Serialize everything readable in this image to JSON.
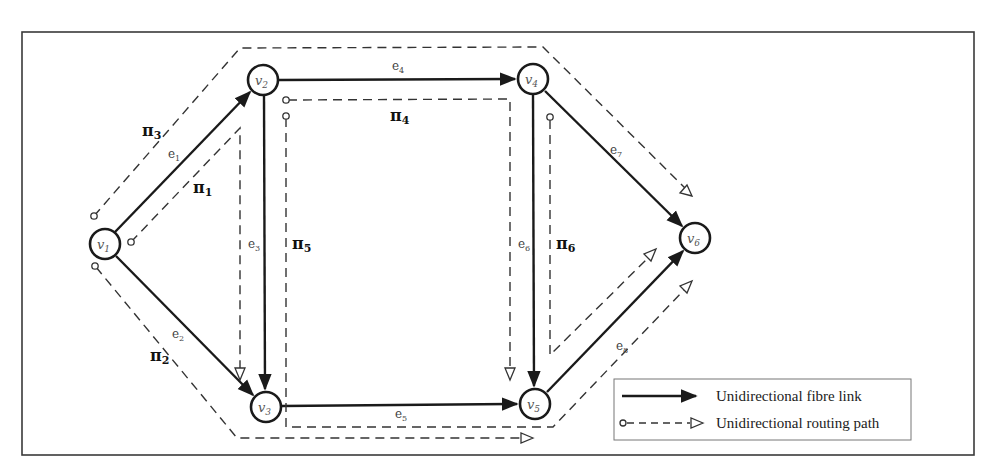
{
  "diagram": {
    "nodes": [
      {
        "id": "v1",
        "label": "v",
        "sub": "1",
        "x": 105,
        "y": 244
      },
      {
        "id": "v2",
        "label": "v",
        "sub": "2",
        "x": 263,
        "y": 80
      },
      {
        "id": "v3",
        "label": "v",
        "sub": "3",
        "x": 266,
        "y": 407
      },
      {
        "id": "v4",
        "label": "v",
        "sub": "4",
        "x": 533,
        "y": 79
      },
      {
        "id": "v5",
        "label": "v",
        "sub": "5",
        "x": 535,
        "y": 404
      },
      {
        "id": "v6",
        "label": "v",
        "sub": "6",
        "x": 695,
        "y": 238
      }
    ],
    "edges": [
      {
        "id": "e1",
        "label": "e",
        "sub": "1",
        "from": "v1",
        "to": "v2"
      },
      {
        "id": "e2",
        "label": "e",
        "sub": "2",
        "from": "v1",
        "to": "v3"
      },
      {
        "id": "e3",
        "label": "e",
        "sub": "3",
        "from": "v2",
        "to": "v3"
      },
      {
        "id": "e4",
        "label": "e",
        "sub": "4",
        "from": "v2",
        "to": "v4"
      },
      {
        "id": "e5",
        "label": "e",
        "sub": "5",
        "from": "v3",
        "to": "v5"
      },
      {
        "id": "e6",
        "label": "e",
        "sub": "6",
        "from": "v4",
        "to": "v5"
      },
      {
        "id": "e7",
        "label": "e",
        "sub": "7",
        "from": "v4",
        "to": "v6"
      },
      {
        "id": "e8",
        "label": "e",
        "sub": "8",
        "from": "v5",
        "to": "v6"
      }
    ],
    "paths": [
      {
        "id": "pi1",
        "label": "π",
        "sub": "1",
        "route": [
          "v1",
          "v2",
          "v3"
        ]
      },
      {
        "id": "pi2",
        "label": "π",
        "sub": "2",
        "route": [
          "v1",
          "v3",
          "v5"
        ]
      },
      {
        "id": "pi3",
        "label": "π",
        "sub": "3",
        "route": [
          "v1",
          "v2",
          "v4",
          "v6"
        ]
      },
      {
        "id": "pi4",
        "label": "π",
        "sub": "4",
        "route": [
          "v2",
          "v4",
          "v5"
        ]
      },
      {
        "id": "pi5",
        "label": "π",
        "sub": "5",
        "route": [
          "v2",
          "v3",
          "v5",
          "v6"
        ]
      },
      {
        "id": "pi6",
        "label": "π",
        "sub": "6",
        "route": [
          "v4",
          "v5",
          "v6"
        ]
      }
    ],
    "legend": {
      "link_label": "Unidirectional fibre link",
      "path_label": "Unidirectional routing path"
    }
  }
}
